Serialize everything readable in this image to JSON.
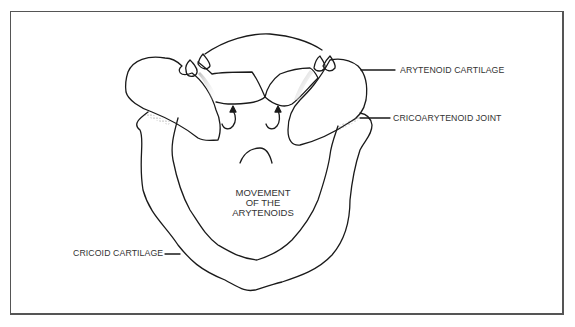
{
  "figure": {
    "labels": {
      "arytenoid_cartilage": "ARYTENOID CARTILAGE",
      "cricoarytenoid_joint": "CRICOARYTENOID JOINT",
      "cricoid_cartilage": "CRICOID CARTILAGE"
    },
    "center_caption": {
      "line1": "MOVEMENT",
      "line2": "OF THE",
      "line3": "ARYTENOIDS"
    },
    "colors": {
      "line": "#1a1a1a",
      "frame": "#555555",
      "text": "#333333",
      "stipple": "#888888"
    }
  }
}
